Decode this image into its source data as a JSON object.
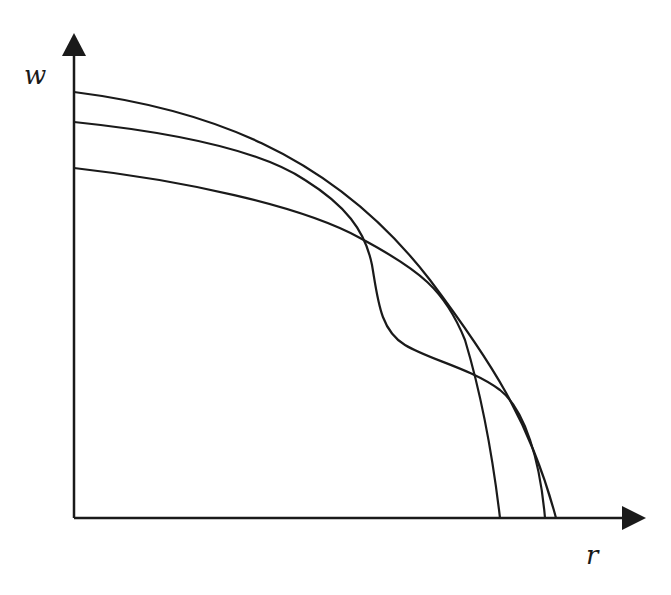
{
  "diagram": {
    "axes": {
      "y_label": "w",
      "x_label": "r",
      "origin": [
        74,
        518
      ],
      "y_axis_top": [
        74,
        33
      ],
      "x_axis_right": [
        645,
        518
      ]
    },
    "curves": [
      {
        "name": "outer-arc",
        "path": "M74,92 C200,108 330,150 430,280 C490,360 530,420 556,518"
      },
      {
        "name": "wiggly-curve",
        "path": "M74,122 C170,132 260,150 305,180 C345,205 365,230 372,265 C378,300 380,330 405,345 C430,360 470,368 500,390 C525,410 540,460 545,518"
      },
      {
        "name": "inner-curve",
        "path": "M74,168 C180,180 300,205 360,238 C420,270 445,290 465,340 C480,390 492,450 500,518"
      }
    ],
    "colors": {
      "stroke": "#1a1a1a",
      "background": "#ffffff"
    }
  }
}
